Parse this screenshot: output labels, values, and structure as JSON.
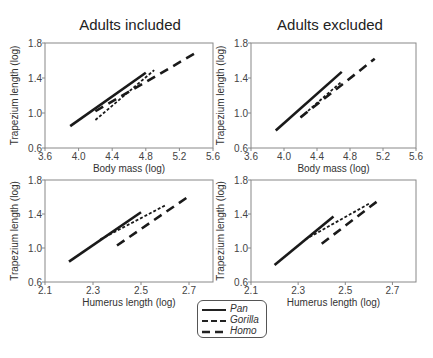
{
  "titles": {
    "left": "Adults included",
    "right": "Adults excluded"
  },
  "legend": {
    "items": [
      {
        "label": "Pan",
        "style": "solid"
      },
      {
        "label": "Gorilla",
        "style": "dotted"
      },
      {
        "label": "Homo",
        "style": "dashed"
      }
    ]
  },
  "chart_data": [
    {
      "type": "line",
      "title": "Adults included",
      "xlabel": "Body mass (log)",
      "ylabel": "Trapezium length (log)",
      "xlim": [
        3.6,
        5.6
      ],
      "ylim": [
        0.6,
        1.8
      ],
      "xticks": [
        "3.6",
        "4.0",
        "4.4",
        "4.8",
        "5.2",
        "5.6"
      ],
      "yticks": [
        "0.6",
        "1.0",
        "1.4",
        "1.8"
      ],
      "grid": false,
      "series": [
        {
          "name": "Pan",
          "x": [
            3.9,
            4.8
          ],
          "y": [
            0.85,
            1.46
          ]
        },
        {
          "name": "Gorilla",
          "x": [
            4.2,
            4.9
          ],
          "y": [
            0.92,
            1.49
          ]
        },
        {
          "name": "Homo",
          "x": [
            4.2,
            5.4
          ],
          "y": [
            1.02,
            1.69
          ]
        }
      ]
    },
    {
      "type": "line",
      "title": "Adults excluded",
      "xlabel": "Body mass (log)",
      "ylabel": "Trapezium length (log)",
      "xlim": [
        3.6,
        5.6
      ],
      "ylim": [
        0.6,
        1.8
      ],
      "xticks": [
        "3.6",
        "4.0",
        "4.4",
        "4.8",
        "5.2",
        "5.6"
      ],
      "yticks": [
        "0.6",
        "1.0",
        "1.4",
        "1.8"
      ],
      "grid": false,
      "series": [
        {
          "name": "Pan",
          "x": [
            3.9,
            4.7
          ],
          "y": [
            0.8,
            1.47
          ]
        },
        {
          "name": "Gorilla",
          "x": [
            4.2,
            4.7
          ],
          "y": [
            0.95,
            1.36
          ]
        },
        {
          "name": "Homo",
          "x": [
            4.2,
            5.1
          ],
          "y": [
            0.95,
            1.62
          ]
        }
      ]
    },
    {
      "type": "line",
      "title": "",
      "xlabel": "Humerus length (log)",
      "ylabel": "Trapezium length (log)",
      "xlim": [
        2.1,
        2.8
      ],
      "ylim": [
        0.6,
        1.8
      ],
      "xticks": [
        "2.1",
        "2.3",
        "2.5",
        "2.7"
      ],
      "yticks": [
        "0.6",
        "1.0",
        "1.4",
        "1.8"
      ],
      "grid": false,
      "series": [
        {
          "name": "Pan",
          "x": [
            2.2,
            2.5
          ],
          "y": [
            0.84,
            1.42
          ]
        },
        {
          "name": "Gorilla",
          "x": [
            2.33,
            2.6
          ],
          "y": [
            1.1,
            1.5
          ]
        },
        {
          "name": "Homo",
          "x": [
            2.4,
            2.7
          ],
          "y": [
            1.03,
            1.61
          ]
        }
      ]
    },
    {
      "type": "line",
      "title": "",
      "xlabel": "Humerus length (log)",
      "ylabel": "Trapezium length (log)",
      "xlim": [
        2.1,
        2.8
      ],
      "ylim": [
        0.6,
        1.8
      ],
      "xticks": [
        "2.1",
        "2.3",
        "2.5",
        "2.7"
      ],
      "yticks": [
        "0.6",
        "1.0",
        "1.4",
        "1.8"
      ],
      "grid": false,
      "series": [
        {
          "name": "Pan",
          "x": [
            2.2,
            2.45
          ],
          "y": [
            0.8,
            1.37
          ]
        },
        {
          "name": "Gorilla",
          "x": [
            2.33,
            2.6
          ],
          "y": [
            1.1,
            1.52
          ]
        },
        {
          "name": "Homo",
          "x": [
            2.4,
            2.65
          ],
          "y": [
            1.05,
            1.58
          ]
        }
      ]
    }
  ]
}
